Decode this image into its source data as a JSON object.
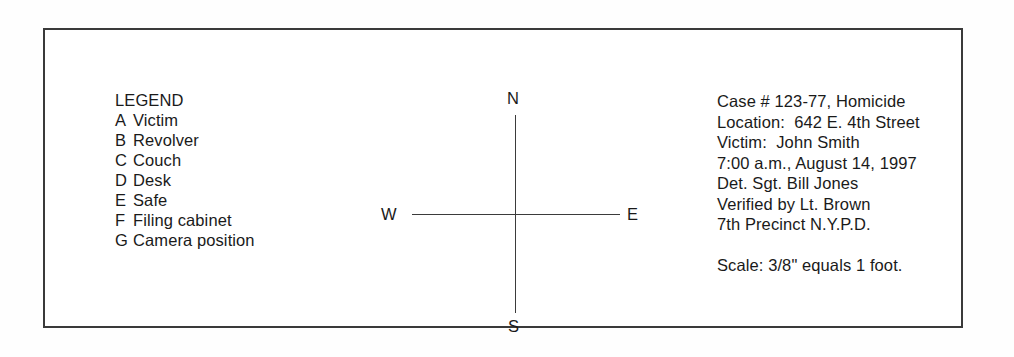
{
  "document": {
    "kind": "crime-scene-sketch-legend",
    "frame_color": "#3a3a3a",
    "text_color": "#1a1a1a",
    "background": "#ffffff"
  },
  "legend": {
    "title": "LEGEND",
    "entries": [
      {
        "key": "A",
        "label": "Victim"
      },
      {
        "key": "B",
        "label": "Revolver"
      },
      {
        "key": "C",
        "label": "Couch"
      },
      {
        "key": "D",
        "label": "Desk"
      },
      {
        "key": "E",
        "label": "Safe"
      },
      {
        "key": "F",
        "label": "Filing cabinet"
      },
      {
        "key": "G",
        "label": "Camera position"
      }
    ]
  },
  "compass": {
    "north": "N",
    "south": "S",
    "west": "W",
    "east": "E",
    "line_color": "#3b3b3b"
  },
  "case_info": {
    "lines": [
      "Case # 123-77, Homicide",
      "Location:  642 E. 4th Street",
      "Victim:  John Smith",
      "7:00 a.m., August 14, 1997",
      "Det. Sgt. Bill Jones",
      "Verified by Lt. Brown",
      "7th Precinct N.Y.P.D."
    ],
    "scale": "Scale: 3/8\" equals 1 foot."
  }
}
